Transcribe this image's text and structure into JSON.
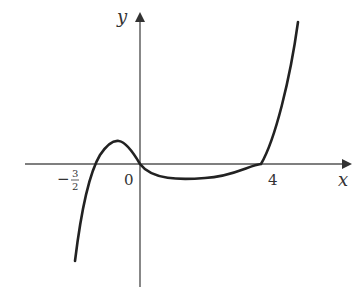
{
  "diagram": {
    "type": "function-graph",
    "axes": {
      "x_label": "x",
      "y_label": "y"
    },
    "labels": {
      "origin": "0",
      "neg_root_sign": "−",
      "neg_root_num": "3",
      "neg_root_den": "2",
      "pos_root": "4"
    },
    "roots": [
      -1.5,
      0,
      4
    ],
    "curve_color": "#222222",
    "axis_color": "#555555"
  }
}
